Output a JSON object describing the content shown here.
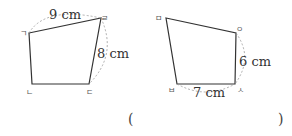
{
  "figures": [
    {
      "name": "left-quadrilateral",
      "vertices": {
        "g": {
          "label": "ㄱ",
          "x": 29,
          "y": 33
        },
        "r": {
          "label": "ㄹ",
          "x": 101,
          "y": 18
        },
        "d": {
          "label": "ㄷ",
          "x": 89,
          "y": 84
        },
        "n": {
          "label": "ㄴ",
          "x": 32,
          "y": 84
        }
      },
      "measurements": [
        {
          "side": "ㄱㄹ",
          "label": "9 cm"
        },
        {
          "side": "ㄹㄷ",
          "label": "8 cm"
        }
      ]
    },
    {
      "name": "right-quadrilateral",
      "vertices": {
        "m": {
          "label": "ㅁ",
          "x": 166,
          "y": 18
        },
        "o": {
          "label": "ㅇ",
          "x": 236,
          "y": 33
        },
        "s": {
          "label": "ㅅ",
          "x": 235,
          "y": 84
        },
        "b": {
          "label": "ㅂ",
          "x": 177,
          "y": 84
        }
      },
      "measurements": [
        {
          "side": "ㅇㅅ",
          "label": "6 cm"
        },
        {
          "side": "ㅂㅅ",
          "label": "7 cm"
        }
      ]
    }
  ],
  "answer": {
    "open_paren": "(",
    "close_paren": ")",
    "value": ""
  },
  "colors": {
    "line": "#333333",
    "dash": "#999999"
  }
}
